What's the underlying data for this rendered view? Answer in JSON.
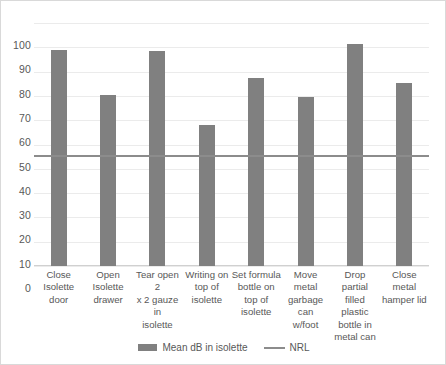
{
  "chart_data": {
    "type": "bar",
    "title": "",
    "subtitle": "",
    "xlabel": "",
    "ylabel": "",
    "ylim": [
      0,
      100
    ],
    "ytick_step": 10,
    "yticks": [
      "100",
      "90",
      "80",
      "70",
      "60",
      "50",
      "40",
      "30",
      "20",
      "10",
      "0"
    ],
    "grid": true,
    "legend_position": "bottom",
    "categories": [
      "Close Isolette door",
      "Open Isolette drawer",
      "Tear open 2 x 2 gauze in isolette",
      "Writing on top of isolette",
      "Set formula bottle on top of isolette",
      "Move metal garbage can w/foot",
      "Drop partial filled plastic bottle in metal can",
      "Close metal hamper lid"
    ],
    "category_lines": [
      [
        "Close",
        "Isolette",
        "door"
      ],
      [
        "Open",
        "Isolette",
        "drawer"
      ],
      [
        "Tear open 2",
        "x 2 gauze in",
        "isolette"
      ],
      [
        "Writing on",
        "top of",
        "isolette"
      ],
      [
        "Set formula",
        "bottle on",
        "top of",
        "isolette"
      ],
      [
        "Move metal",
        "garbage can",
        "w/foot"
      ],
      [
        "Drop partial",
        "filled plastic",
        "bottle in",
        "metal can"
      ],
      [
        "Close metal",
        "hamper lid"
      ]
    ],
    "series": [
      {
        "name": "Mean dB in isolette",
        "type": "bar",
        "color": "#808080",
        "values": [
          89,
          70.5,
          88.5,
          58,
          77.5,
          69.5,
          91.5,
          75.5
        ]
      },
      {
        "name": "NRL",
        "type": "reference-line",
        "color": "#8C8C8C",
        "value": 45
      }
    ],
    "legend": [
      {
        "label": "Mean dB in isolette",
        "marker": "bar-swatch",
        "color": "#808080"
      },
      {
        "label": "NRL",
        "marker": "line-swatch",
        "color": "#8C8C8C"
      }
    ],
    "colors": {
      "bar": "#808080",
      "reference_line": "#8C8C8C",
      "gridline": "#EBEBEB",
      "axis_text": "#585858",
      "background": "#FFFFFF",
      "border": "#D9D9D9"
    }
  }
}
